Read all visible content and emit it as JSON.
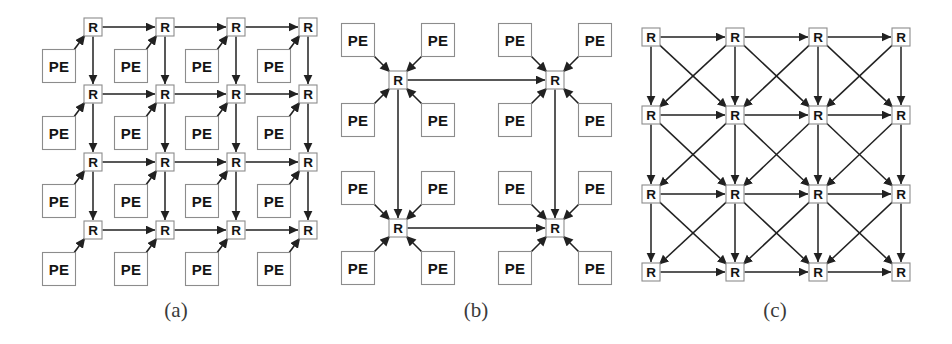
{
  "figure": {
    "background": "#ffffff",
    "line_color": "#212121",
    "box_border_color": "#8c8c8c",
    "box_fill_color": "#ffffff",
    "labels": {
      "router": "R",
      "processing_element": "PE"
    },
    "panels": [
      {
        "id": "a",
        "caption": "(a)",
        "name": "mesh-one-pe-per-router",
        "router_rows": 4,
        "router_cols": 4,
        "pe_per_router": 1,
        "pe_count": 16,
        "router_count": 16,
        "link_types": [
          "horizontal",
          "vertical",
          "pe-to-router-diagonal"
        ],
        "bidirectional": true
      },
      {
        "id": "b",
        "caption": "(b)",
        "name": "concentrated-mesh-four-pe-per-router",
        "router_rows": 2,
        "router_cols": 2,
        "pe_per_router": 4,
        "pe_count": 16,
        "router_count": 4,
        "link_types": [
          "horizontal",
          "vertical",
          "pe-to-router-diagonal"
        ],
        "bidirectional": true
      },
      {
        "id": "c",
        "caption": "(c)",
        "name": "mesh-with-diagonal-express-links",
        "router_rows": 4,
        "router_cols": 4,
        "pe_per_router": 0,
        "pe_count": 0,
        "router_count": 16,
        "link_types": [
          "horizontal",
          "vertical",
          "diagonal"
        ],
        "bidirectional": true
      }
    ]
  },
  "chart_data": {
    "type": "diagram",
    "panels": [
      {
        "caption": "(a)",
        "routers": [
          {
            "id": "R00",
            "x": 93,
            "y": 27
          },
          {
            "id": "R01",
            "x": 165,
            "y": 27
          },
          {
            "id": "R02",
            "x": 236,
            "y": 27
          },
          {
            "id": "R03",
            "x": 308,
            "y": 27
          },
          {
            "id": "R10",
            "x": 93,
            "y": 94
          },
          {
            "id": "R11",
            "x": 165,
            "y": 94
          },
          {
            "id": "R12",
            "x": 236,
            "y": 94
          },
          {
            "id": "R13",
            "x": 308,
            "y": 94
          },
          {
            "id": "R20",
            "x": 93,
            "y": 162
          },
          {
            "id": "R21",
            "x": 165,
            "y": 162
          },
          {
            "id": "R22",
            "x": 236,
            "y": 162
          },
          {
            "id": "R23",
            "x": 308,
            "y": 162
          },
          {
            "id": "R30",
            "x": 93,
            "y": 230
          },
          {
            "id": "R31",
            "x": 165,
            "y": 230
          },
          {
            "id": "R32",
            "x": 236,
            "y": 230
          },
          {
            "id": "R33",
            "x": 308,
            "y": 230
          }
        ],
        "pe_offset": {
          "dx": -34,
          "dy": 39
        },
        "grid_dx": 71.5,
        "grid_dy": 67.5
      },
      {
        "caption": "(b)",
        "routers": [
          {
            "id": "R00",
            "x": 398,
            "y": 80
          },
          {
            "id": "R01",
            "x": 555,
            "y": 80
          },
          {
            "id": "R10",
            "x": 398,
            "y": 228
          },
          {
            "id": "R11",
            "x": 555,
            "y": 228
          }
        ],
        "pe_diagonal_offset": {
          "dx": 40,
          "dy": 40
        },
        "grid_dx": 157,
        "grid_dy": 148
      },
      {
        "caption": "(c)",
        "routers": [
          {
            "id": "R00",
            "x": 651,
            "y": 37
          },
          {
            "id": "R01",
            "x": 735,
            "y": 37
          },
          {
            "id": "R02",
            "x": 818,
            "y": 37
          },
          {
            "id": "R03",
            "x": 901,
            "y": 37
          },
          {
            "id": "R10",
            "x": 651,
            "y": 115
          },
          {
            "id": "R11",
            "x": 735,
            "y": 115
          },
          {
            "id": "R12",
            "x": 818,
            "y": 115
          },
          {
            "id": "R13",
            "x": 901,
            "y": 115
          },
          {
            "id": "R20",
            "x": 651,
            "y": 194
          },
          {
            "id": "R21",
            "x": 735,
            "y": 194
          },
          {
            "id": "R22",
            "x": 818,
            "y": 194
          },
          {
            "id": "R23",
            "x": 901,
            "y": 194
          },
          {
            "id": "R30",
            "x": 651,
            "y": 272
          },
          {
            "id": "R31",
            "x": 735,
            "y": 272
          },
          {
            "id": "R32",
            "x": 818,
            "y": 272
          },
          {
            "id": "R33",
            "x": 901,
            "y": 272
          }
        ],
        "grid_dx": 83.3,
        "grid_dy": 78.3
      }
    ]
  }
}
